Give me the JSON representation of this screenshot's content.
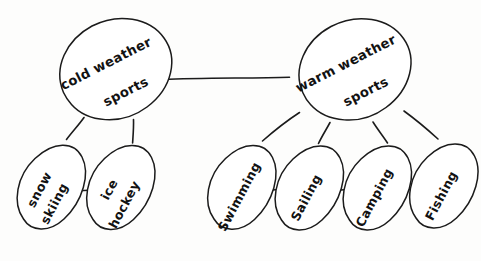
{
  "diagram": {
    "background_color": "#fdfdfc",
    "stroke_color": "#1b1b1b",
    "style": "hand-drawn"
  },
  "nodes": {
    "cold_root": {
      "label_line1": "cold weather",
      "label_line2": "sports",
      "cx": 112,
      "cy": 76,
      "rx": 64,
      "ry": 46,
      "rotation": -28
    },
    "warm_root": {
      "label_line1": "warm weather",
      "label_line2": "sports",
      "cx": 352,
      "cy": 76,
      "rx": 64,
      "ry": 46,
      "rotation": -28
    },
    "snow_skiing": {
      "label_line1": "snow",
      "label_line2": "skiing",
      "cx": 47,
      "cy": 197,
      "rx": 48,
      "ry": 30,
      "rotation": -62
    },
    "ice_hockey": {
      "label_line1": "ice",
      "label_line2": "hockey",
      "cx": 117,
      "cy": 197,
      "rx": 48,
      "ry": 30,
      "rotation": -62
    },
    "swimming": {
      "label_line1": "Swimming",
      "label_line2": "",
      "cx": 238,
      "cy": 197,
      "rx": 48,
      "ry": 30,
      "rotation": -62
    },
    "sailing": {
      "label_line1": "Sailing",
      "label_line2": "",
      "cx": 305,
      "cy": 198,
      "rx": 48,
      "ry": 30,
      "rotation": -62
    },
    "camping": {
      "label_line1": "Camping",
      "label_line2": "",
      "cx": 373,
      "cy": 198,
      "rx": 48,
      "ry": 30,
      "rotation": -62
    },
    "fishing": {
      "label_line1": "Fishing",
      "label_line2": "",
      "cx": 440,
      "cy": 196,
      "rx": 48,
      "ry": 30,
      "rotation": -62
    }
  },
  "connectors": [
    {
      "name": "cold-to-warm",
      "from": "cold_root",
      "to": "warm_root"
    },
    {
      "name": "cold-to-snow-skiing",
      "from": "cold_root",
      "to": "snow_skiing"
    },
    {
      "name": "cold-to-ice-hockey",
      "from": "cold_root",
      "to": "ice_hockey"
    },
    {
      "name": "snow-skiing-to-ice-hockey",
      "from": "snow_skiing",
      "to": "ice_hockey"
    },
    {
      "name": "warm-to-swimming",
      "from": "warm_root",
      "to": "swimming"
    },
    {
      "name": "warm-to-sailing",
      "from": "warm_root",
      "to": "sailing"
    },
    {
      "name": "warm-to-camping",
      "from": "warm_root",
      "to": "camping"
    },
    {
      "name": "warm-to-fishing",
      "from": "warm_root",
      "to": "fishing"
    },
    {
      "name": "swimming-to-sailing",
      "from": "swimming",
      "to": "sailing"
    },
    {
      "name": "sailing-to-camping",
      "from": "sailing",
      "to": "camping"
    },
    {
      "name": "camping-to-fishing",
      "from": "camping",
      "to": "fishing"
    }
  ]
}
